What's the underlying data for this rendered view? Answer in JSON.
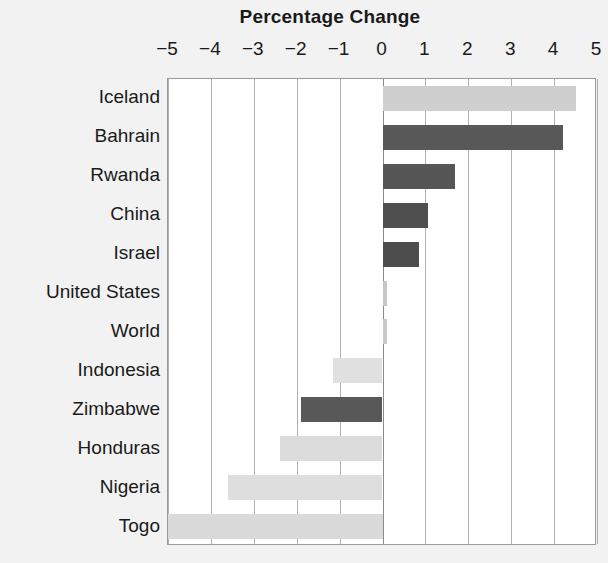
{
  "chart_data": {
    "type": "bar",
    "orientation": "horizontal",
    "title": "Percentage Change",
    "xlabel": "",
    "ylabel": "",
    "xlim": [
      -5,
      5
    ],
    "xticks": [
      -5,
      -4,
      -3,
      -2,
      -1,
      0,
      1,
      2,
      3,
      4,
      5
    ],
    "xtick_labels": [
      "−5",
      "−4",
      "−3",
      "−2",
      "−1",
      "0",
      "1",
      "2",
      "3",
      "4",
      "5"
    ],
    "grid": true,
    "grid_axis": "x",
    "legend": "none",
    "categories": [
      "Iceland",
      "Bahrain",
      "Rwanda",
      "China",
      "Israel",
      "United States",
      "World",
      "Indonesia",
      "Zimbabwe",
      "Honduras",
      "Nigeria",
      "Togo"
    ],
    "values": [
      4.5,
      4.2,
      1.7,
      1.05,
      0.85,
      0.1,
      0.1,
      -1.15,
      -1.9,
      -2.4,
      -3.6,
      -5.0
    ],
    "bar_colors": [
      "#cfcfcf",
      "#585858",
      "#565656",
      "#4f4f4f",
      "#4d4d4d",
      "#c6c6c6",
      "#c8c8c8",
      "#e0e0e0",
      "#585858",
      "#dcdcdc",
      "#dedede",
      "#dadada"
    ]
  },
  "style": {
    "figure_background": "#f2f2f2",
    "plot_background": "#ffffff",
    "gridline_color": "#b0b0b0",
    "zero_line_color": "#8a8a8a",
    "axis_frame_color": "#9a9a9a",
    "text_color": "#1a1a1a"
  }
}
